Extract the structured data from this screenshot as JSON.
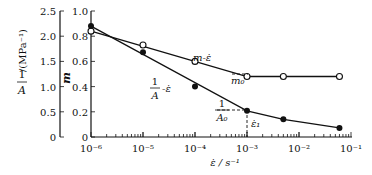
{
  "chart_data": {
    "type": "line",
    "title": "",
    "xlabel": "ε̇ / s⁻¹",
    "x_scale": "log",
    "x_ticks": [
      "10⁻⁶",
      "10⁻⁵",
      "10⁻⁴",
      "10⁻³",
      "10⁻²",
      "10⁻¹"
    ],
    "xlim": [
      1e-06,
      0.1
    ],
    "y_axes": [
      {
        "label": "1/A /(MPa⁻¹)",
        "ticks": [
          "0",
          "0.5",
          "1.0",
          "1.5",
          "2.0",
          "2.5"
        ],
        "ylim": [
          0,
          2.5
        ]
      },
      {
        "label": "m",
        "ticks": [
          "0",
          "0.2",
          "0.4",
          "0.6",
          "0.8",
          "1.0"
        ],
        "ylim": [
          0,
          1.0
        ]
      }
    ],
    "series": [
      {
        "name": "m-ε̇",
        "marker": "open-circle",
        "axis": "m",
        "x": [
          1e-06,
          1e-05,
          0.0001,
          0.001,
          0.005,
          0.06
        ],
        "y": [
          0.84,
          0.73,
          0.6,
          0.48,
          0.48,
          0.48
        ]
      },
      {
        "name": "1/A-ε̇",
        "marker": "filled-circle",
        "axis": "1/A",
        "x": [
          1e-06,
          1e-05,
          0.0001,
          0.001,
          0.005,
          0.06
        ],
        "y": [
          2.2,
          1.68,
          1.0,
          0.52,
          0.35,
          0.18
        ]
      }
    ],
    "annotations": [
      {
        "text": "m-ε̇",
        "near": "m curve"
      },
      {
        "text": "1/A - ε̇",
        "near": "1/A curve"
      },
      {
        "text": "m₀",
        "near": "m plateau at 1e-3"
      },
      {
        "text": "1/A₀",
        "near": "1/A at 1e-3"
      },
      {
        "text": "ε̇₁",
        "near": "x = 1e-3"
      }
    ]
  },
  "labels": {
    "y_left_num": "1",
    "y_left_den": "A",
    "y_left_unit": "/(MPa⁻¹)",
    "y_right": "m",
    "x_label": "ε̇ / s⁻¹",
    "m_curve": "m-ε̇",
    "a_curve_num": "1",
    "a_curve_den": "A",
    "a_curve_tail": "-ε̇",
    "m0": "m₀",
    "a0_num": "1",
    "a0_den": "A₀",
    "eps1": "ε̇₁"
  }
}
